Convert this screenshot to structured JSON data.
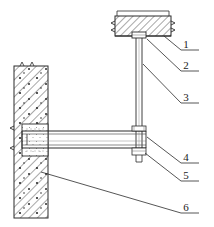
{
  "drawing": {
    "title": "Structural connection detail",
    "type": "engineering-section-detail",
    "background_color": "#ffffff",
    "line_color": "#2b2b2b",
    "hatch_color": "#4a4a4a",
    "canvas": {
      "width": 214,
      "height": 227
    }
  },
  "components": {
    "top_slab": {
      "name": "concrete-slab",
      "hatch": "diagonal",
      "x": 115,
      "y": 16,
      "width": 56,
      "height": 20
    },
    "slab_top_line": {
      "name": "slab-upper-reference-line",
      "x1": 117,
      "y1": 11,
      "x2": 169,
      "y2": 11
    },
    "hanger_rod": {
      "name": "vertical-hanger-rod",
      "x": 136,
      "y_top": 36,
      "y_bottom": 152,
      "width": 6
    },
    "anchor_plate": {
      "name": "anchor-plate",
      "x": 132,
      "y": 33,
      "width": 14,
      "height": 5
    },
    "horizontal_beam": {
      "name": "horizontal-steel-beam",
      "x_left": 22,
      "x_right": 146,
      "y_top": 130,
      "y_bottom": 148
    },
    "wall": {
      "name": "concrete-wall",
      "hatch": "diagonal-with-aggregate",
      "x": 14,
      "y": 66,
      "width": 34,
      "height": 152
    },
    "wall_pocket": {
      "name": "beam-embedment-pocket",
      "x": 22,
      "y": 124,
      "width": 26,
      "height": 30
    },
    "nut_assembly": {
      "name": "nut-and-washer-assembly",
      "x": 131,
      "y": 126,
      "width": 16,
      "height": 30
    }
  },
  "labels": [
    {
      "id": "callout-1",
      "text": "1",
      "x": 186,
      "y": 43,
      "leader": {
        "x1": 166,
        "y1": 36,
        "x2": 181,
        "y2": 50,
        "x3": 199,
        "y3": 50
      }
    },
    {
      "id": "callout-2",
      "text": "2",
      "x": 186,
      "y": 64,
      "leader": {
        "x1": 146,
        "y1": 40,
        "x2": 181,
        "y2": 71,
        "x3": 199,
        "y3": 71
      }
    },
    {
      "id": "callout-3",
      "text": "3",
      "x": 186,
      "y": 96,
      "leader": {
        "x1": 142,
        "y1": 64,
        "x2": 181,
        "y2": 103,
        "x3": 199,
        "y3": 103
      }
    },
    {
      "id": "callout-4",
      "text": "4",
      "x": 186,
      "y": 156,
      "leader": {
        "x1": 146,
        "y1": 136,
        "x2": 181,
        "y2": 163,
        "x3": 199,
        "y3": 163
      }
    },
    {
      "id": "callout-5",
      "text": "5",
      "x": 186,
      "y": 174,
      "leader": {
        "x1": 144,
        "y1": 152,
        "x2": 181,
        "y2": 181,
        "x3": 199,
        "y3": 181
      }
    },
    {
      "id": "callout-6",
      "text": "6",
      "x": 186,
      "y": 206,
      "leader": {
        "x1": 41,
        "y1": 172,
        "x2": 181,
        "y2": 213,
        "x3": 199,
        "y3": 213
      }
    }
  ]
}
